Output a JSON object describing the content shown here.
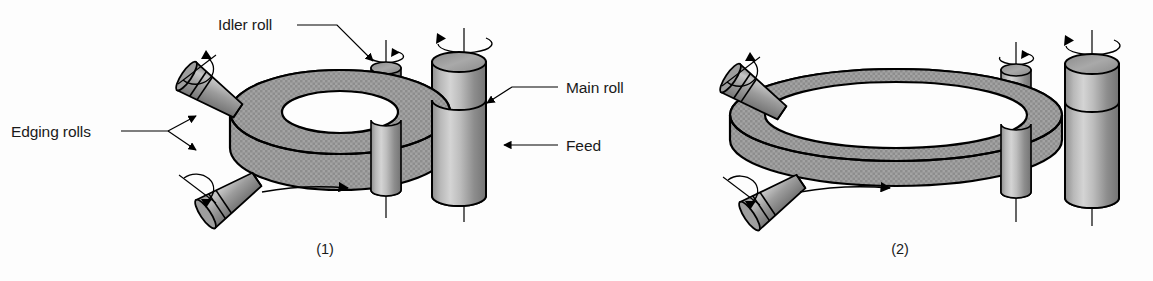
{
  "figure": {
    "title_present": false,
    "background_color": "#fdfdfd",
    "ink_color": "#000000",
    "metal_fill": "#a8a8a8",
    "texture_fill": "#9a9a9a"
  },
  "labels": {
    "idler_roll": "Idler roll",
    "edging_rolls": "Edging rolls",
    "main_roll": "Main roll",
    "feed": "Feed"
  },
  "captions": {
    "panel_one": "(1)",
    "panel_two": "(2)"
  },
  "panels": [
    {
      "caption": "(1)",
      "description": "Ring rolling stage one: thick small-diameter ring between main roll, idler roll and two edging rolls",
      "components": [
        "main-roll",
        "idler-roll",
        "edging-roll-upper",
        "edging-roll-lower",
        "workpiece-ring",
        "feed-arrow"
      ]
    },
    {
      "caption": "(2)",
      "description": "Ring rolling stage two: ring expanded to larger diameter and reduced thickness",
      "components": [
        "main-roll",
        "idler-roll",
        "edging-roll-upper",
        "edging-roll-lower",
        "workpiece-ring",
        "feed-arrow"
      ]
    }
  ],
  "annotations": {
    "rotation_arrows": 4,
    "feed_arrows": 2,
    "leader_lines": 4
  }
}
